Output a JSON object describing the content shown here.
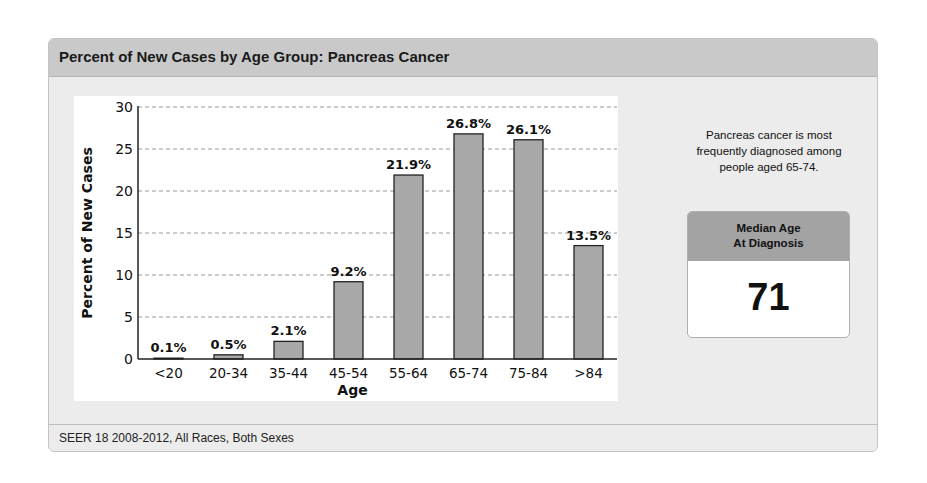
{
  "panel": {
    "title": "Percent of New Cases by Age Group: Pancreas Cancer",
    "footer": "SEER 18 2008-2012, All Races, Both Sexes"
  },
  "sidebar": {
    "note": "Pancreas cancer is most frequently diagnosed among people aged 65-74.",
    "median_label_line1": "Median Age",
    "median_label_line2": "At Diagnosis",
    "median_value": "71"
  },
  "colors": {
    "bar_fill": "#a8a8a8",
    "bar_stroke": "#222222",
    "header_bg": "#c9c9c9",
    "median_head_bg": "#a3a3a3"
  },
  "chart_data": {
    "type": "bar",
    "title": "Percent of New Cases by Age Group: Pancreas Cancer",
    "xlabel": "Age",
    "ylabel": "Percent of New Cases",
    "categories": [
      "<20",
      "20-34",
      "35-44",
      "45-54",
      "55-64",
      "65-74",
      "75-84",
      ">84"
    ],
    "values": [
      0.1,
      0.5,
      2.1,
      9.2,
      21.9,
      26.8,
      26.1,
      13.5
    ],
    "data_labels": [
      "0.1%",
      "0.5%",
      "2.1%",
      "9.2%",
      "21.9%",
      "26.8%",
      "26.1%",
      "13.5%"
    ],
    "ylim": [
      0,
      30
    ],
    "yticks": [
      0,
      5,
      10,
      15,
      20,
      25,
      30
    ],
    "grid": true,
    "grid_style": "dashed horizontal",
    "legend": null
  }
}
